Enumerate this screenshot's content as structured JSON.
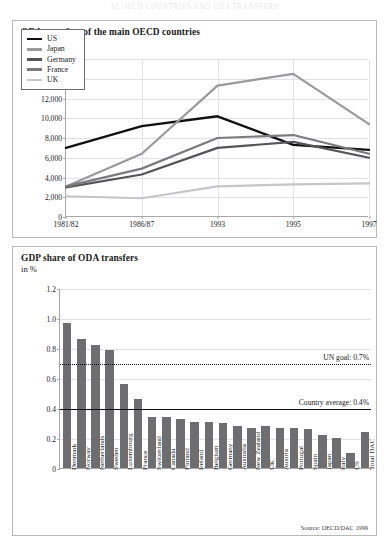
{
  "page_header": "12   OECD COUNTRIES AND ODA TRANSFERS",
  "figure1": {
    "title": "ODA transfers of the main OECD countries",
    "subtitle": "in bn US$",
    "legend": [
      {
        "label": "US",
        "color": "#111111"
      },
      {
        "label": "Japan",
        "color": "#9a9a9c"
      },
      {
        "label": "Germany",
        "color": "#555557"
      },
      {
        "label": "France",
        "color": "#7b7b7d"
      },
      {
        "label": "UK",
        "color": "#c6c6c8"
      }
    ],
    "chart_data": {
      "type": "line",
      "title": "ODA transfers of the main OECD countries",
      "ylabel": "in bn US$",
      "xlabel": "",
      "ylim": [
        0,
        16000
      ],
      "ytick_labels": [
        "0",
        "2,000",
        "4,000",
        "6,000",
        "8,000",
        "10,000",
        "12,000",
        "14,000",
        "16,000"
      ],
      "ytick_values": [
        0,
        2000,
        4000,
        6000,
        8000,
        10000,
        12000,
        14000,
        16000
      ],
      "grid": true,
      "legend_position": "upper-left-inset",
      "x": [
        "1981/82",
        "1986/87",
        "1993",
        "1995",
        "1997"
      ],
      "series": [
        {
          "name": "US",
          "color": "#111111",
          "width": 2.4,
          "values": [
            7000,
            9200,
            10200,
            7300,
            6800
          ]
        },
        {
          "name": "Japan",
          "color": "#9a9a9c",
          "width": 2.2,
          "values": [
            3100,
            6400,
            13300,
            14500,
            9400
          ]
        },
        {
          "name": "Germany",
          "color": "#555557",
          "width": 2.2,
          "values": [
            3000,
            4300,
            7000,
            7600,
            6000
          ]
        },
        {
          "name": "France",
          "color": "#7b7b7d",
          "width": 2.2,
          "values": [
            3100,
            4900,
            8000,
            8300,
            6400
          ]
        },
        {
          "name": "UK",
          "color": "#c6c6c8",
          "width": 2.2,
          "values": [
            2100,
            1900,
            3100,
            3300,
            3400
          ]
        }
      ]
    }
  },
  "figure2": {
    "title": "GDP share of ODA transfers",
    "subtitle": "in %",
    "source": "Source: OECD/DAC 1999",
    "un_goal_label": "UN goal: 0.7%",
    "country_average_label": "Country average: 0.4%",
    "chart_data": {
      "type": "bar",
      "title": "GDP share of ODA transfers",
      "ylabel": "in %",
      "xlabel": "",
      "ylim": [
        0,
        1.2
      ],
      "ytick_labels": [
        "0",
        "0.2",
        "0.4",
        "0.6",
        "0.8",
        "1.0",
        "1.2"
      ],
      "ytick_values": [
        0,
        0.2,
        0.4,
        0.6,
        0.8,
        1.0,
        1.2
      ],
      "grid": true,
      "bar_color": "#6e6e70",
      "annotations": [
        {
          "label": "UN goal: 0.7%",
          "value": 0.7,
          "style": "dotted"
        },
        {
          "label": "Country average: 0.4%",
          "value": 0.4,
          "style": "solid"
        }
      ],
      "categories": [
        "Denmark",
        "Norway",
        "Netherlands",
        "Sweden",
        "Luxembourg",
        "France",
        "Switzerland",
        "Canada",
        "Finland",
        "Ireland",
        "Belgium",
        "Germany",
        "Australia",
        "New Zealand",
        "UK",
        "Austria",
        "Portugal",
        "Spain",
        "Japan",
        "Italy",
        "US",
        "Total DAC"
      ],
      "values": [
        0.97,
        0.86,
        0.82,
        0.79,
        0.56,
        0.46,
        0.34,
        0.34,
        0.33,
        0.31,
        0.31,
        0.3,
        0.28,
        0.27,
        0.28,
        0.27,
        0.27,
        0.26,
        0.22,
        0.2,
        0.1,
        0.24
      ]
    }
  }
}
